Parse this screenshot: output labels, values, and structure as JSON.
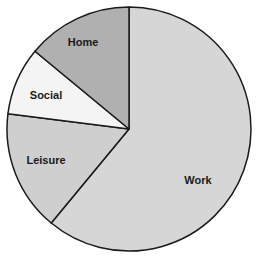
{
  "chart_data": {
    "type": "pie",
    "title": "",
    "start_angle_deg": 0,
    "direction": "clockwise",
    "categories": [
      "Work",
      "Leisure",
      "Social",
      "Home"
    ],
    "values": [
      61,
      16,
      9,
      14
    ],
    "unit": "percent (estimated)",
    "colors": [
      "#d6d6d6",
      "#cfcfcf",
      "#f4f4f4",
      "#b0b0b0"
    ],
    "label_positions": [
      {
        "x": 198,
        "y": 184
      },
      {
        "x": 46,
        "y": 164
      },
      {
        "x": 46,
        "y": 99
      },
      {
        "x": 83,
        "y": 46
      }
    ],
    "legend": "none",
    "labels_inside": true
  },
  "geometry": {
    "cx": 129,
    "cy": 129,
    "r": 122,
    "stroke": "#1a1a1a"
  }
}
